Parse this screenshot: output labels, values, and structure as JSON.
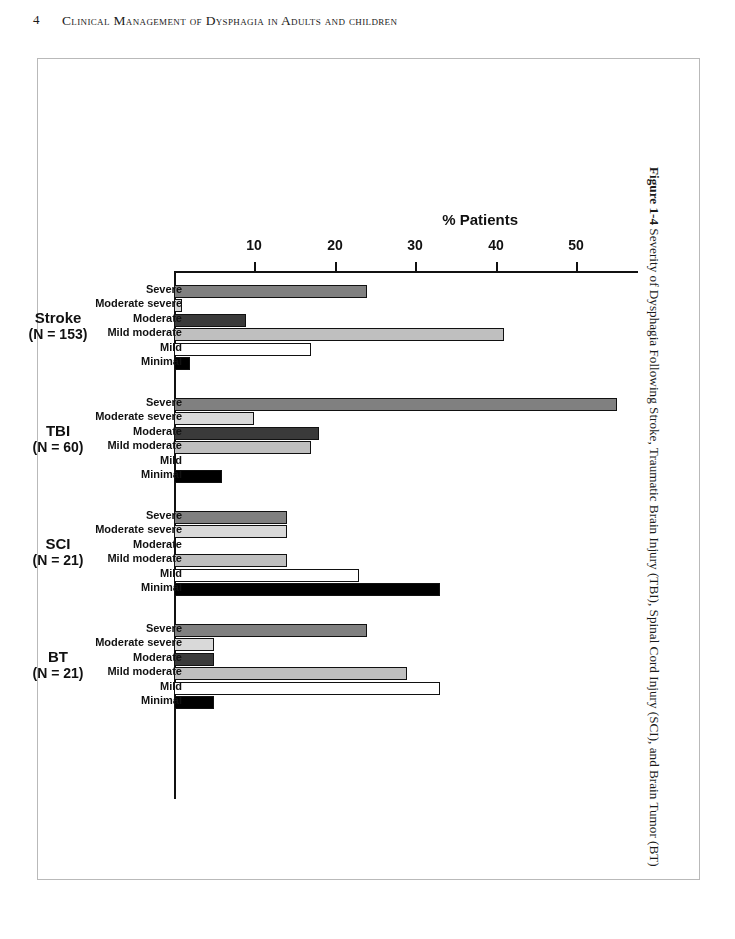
{
  "page": {
    "folio": "4",
    "running_head": "Clinical Management of Dysphagia in Adults and children"
  },
  "caption": {
    "number": "Figure 1-4",
    "text": "Severity of Dysphagia Following Stroke, Traumatic Brain Injury (TBI), Spinal Cord Injury (SCI), and Brain Tumor (BT)"
  },
  "chart_data": {
    "type": "bar",
    "orientation": "horizontal-rotated-180",
    "title": "",
    "xlabel": "",
    "ylabel": "% Patients",
    "ylim": [
      0,
      56
    ],
    "ticks": [
      10,
      20,
      30,
      40,
      50
    ],
    "tick_labels": [
      "10",
      "20",
      "30",
      "40",
      "50"
    ],
    "grid": false,
    "legend": "none",
    "categories": [
      "Severe",
      "Moderate severe",
      "Moderate",
      "Mild moderate",
      "Mild",
      "Minimal"
    ],
    "category_fills": {
      "Severe": "#808080",
      "Moderate severe": "#d9d9d9",
      "Moderate": "#3a3a3a",
      "Mild moderate": "#bfbfbf",
      "Mild": "#ffffff",
      "Minimal": "#000000"
    },
    "groups": [
      {
        "name": "Stroke",
        "n_label": "(N = 153)",
        "n": 153,
        "values": [
          24,
          1,
          9,
          41,
          17,
          2
        ]
      },
      {
        "name": "TBI",
        "n_label": "(N = 60)",
        "n": 60,
        "values": [
          55,
          10,
          18,
          17,
          0,
          6
        ]
      },
      {
        "name": "SCI",
        "n_label": "(N = 21)",
        "n": 21,
        "values": [
          14,
          14,
          0,
          14,
          23,
          33
        ]
      },
      {
        "name": "BT",
        "n_label": "(N = 21)",
        "n": 21,
        "values": [
          24,
          5,
          5,
          29,
          33,
          5
        ]
      }
    ]
  }
}
